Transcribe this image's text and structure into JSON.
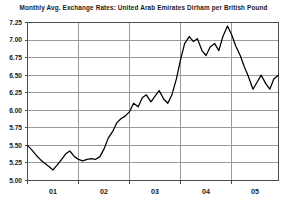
{
  "chart_data": {
    "type": "line",
    "title": "Monthly Avg. Exchange Rates: United Arab Emirates Dirham per British Pound",
    "xlabel": "",
    "ylabel": "",
    "ylim": [
      5.0,
      7.25
    ],
    "xlim": [
      2001.0,
      2005.92
    ],
    "grid": true,
    "legend": false,
    "ytick_labels": [
      "7.25",
      "7.00",
      "6.75",
      "6.50",
      "6.25",
      "6.00",
      "5.75",
      "5.50",
      "5.25",
      "5.00"
    ],
    "ytick_values": [
      7.25,
      7.0,
      6.75,
      6.5,
      6.25,
      6.0,
      5.75,
      5.5,
      5.25,
      5.0
    ],
    "xtick_labels": [
      "01",
      "02",
      "03",
      "04",
      "05"
    ],
    "xtick_values": [
      2001,
      2002,
      2003,
      2004,
      2005
    ],
    "series": [
      {
        "name": "AED per GBP",
        "x": [
          2001.0,
          2001.08,
          2001.17,
          2001.25,
          2001.33,
          2001.42,
          2001.5,
          2001.58,
          2001.67,
          2001.75,
          2001.83,
          2001.92,
          2002.0,
          2002.08,
          2002.17,
          2002.25,
          2002.33,
          2002.42,
          2002.5,
          2002.58,
          2002.67,
          2002.75,
          2002.83,
          2002.92,
          2003.0,
          2003.08,
          2003.17,
          2003.25,
          2003.33,
          2003.42,
          2003.5,
          2003.58,
          2003.67,
          2003.75,
          2003.83,
          2003.92,
          2004.0,
          2004.08,
          2004.17,
          2004.25,
          2004.33,
          2004.42,
          2004.5,
          2004.58,
          2004.67,
          2004.75,
          2004.83,
          2004.92,
          2005.0,
          2005.08,
          2005.17,
          2005.25,
          2005.33,
          2005.42,
          2005.5,
          2005.58,
          2005.67,
          2005.75,
          2005.83,
          2005.92
        ],
        "values": [
          5.5,
          5.44,
          5.36,
          5.3,
          5.25,
          5.2,
          5.15,
          5.22,
          5.3,
          5.38,
          5.42,
          5.34,
          5.3,
          5.28,
          5.3,
          5.31,
          5.3,
          5.34,
          5.45,
          5.6,
          5.7,
          5.82,
          5.88,
          5.92,
          5.98,
          6.1,
          6.05,
          6.18,
          6.22,
          6.12,
          6.2,
          6.28,
          6.16,
          6.1,
          6.22,
          6.45,
          6.72,
          6.95,
          7.05,
          6.98,
          7.02,
          6.85,
          6.78,
          6.9,
          6.95,
          6.85,
          7.05,
          7.2,
          7.08,
          6.92,
          6.78,
          6.62,
          6.48,
          6.3,
          6.4,
          6.5,
          6.38,
          6.3,
          6.45,
          6.5
        ]
      }
    ]
  }
}
